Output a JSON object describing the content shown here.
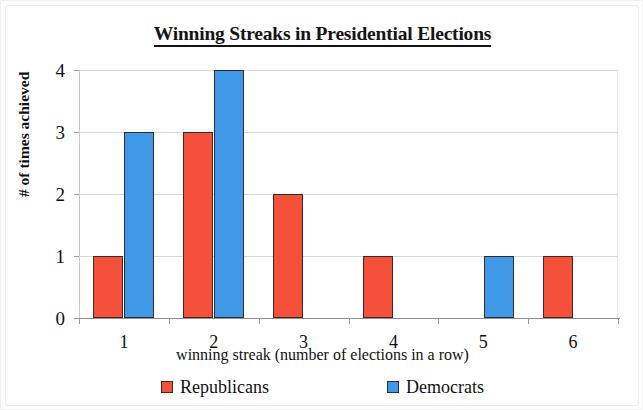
{
  "chart_data": {
    "type": "bar",
    "title": "Winning Streaks in Presidential Elections",
    "xlabel": "winning streak (number of elections in a row)",
    "ylabel": "# of times achieved",
    "categories": [
      "1",
      "2",
      "3",
      "4",
      "5",
      "6"
    ],
    "series": [
      {
        "name": "Republicans",
        "color": "#F4503A",
        "values": [
          1,
          3,
          2,
          1,
          0,
          1
        ]
      },
      {
        "name": "Democrats",
        "color": "#4098E8",
        "values": [
          3,
          4,
          0,
          0,
          1,
          0
        ]
      }
    ],
    "ylim": [
      0,
      4
    ],
    "yticks": [
      "0",
      "1",
      "2",
      "3",
      "4"
    ],
    "grid": true,
    "legend_position": "bottom"
  },
  "legend": {
    "items": [
      {
        "label": "Republicans",
        "color": "#F4503A"
      },
      {
        "label": "Democrats",
        "color": "#4098E8"
      }
    ]
  }
}
